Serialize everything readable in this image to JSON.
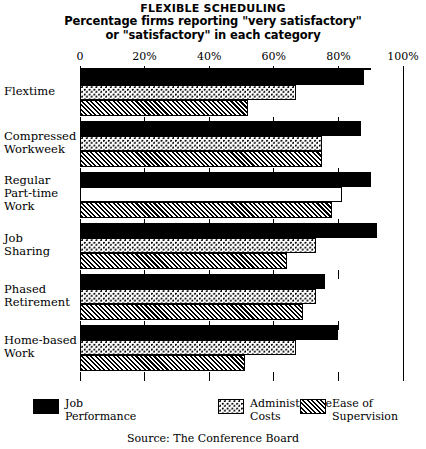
{
  "title": {
    "main": "FLEXIBLE SCHEDULING",
    "sub_line1": "Percentage firms reporting \"very satisfactory\"",
    "sub_line2": "or \"satisfactory\" in each category"
  },
  "source": "Source: The Conference Board",
  "legend": {
    "items": [
      {
        "label": "Job\nPerformance",
        "swatch": "solid-black-swatch"
      },
      {
        "label": "Administrative\nCosts",
        "swatch": "dotted-swatch"
      },
      {
        "label": "Ease of\nSupervision",
        "swatch": "hatched-swatch"
      }
    ]
  },
  "chart_data": {
    "type": "bar",
    "orientation": "horizontal",
    "xlabel": "",
    "ylabel": "",
    "xlim": [
      0,
      100
    ],
    "grid": true,
    "legend_position": "bottom",
    "tick_labels": [
      "0",
      "20%",
      "40%",
      "60%",
      "80%",
      "100%"
    ],
    "tick_values": [
      0,
      20,
      40,
      60,
      80,
      100
    ],
    "categories": [
      "Flextime",
      "Compressed\nWorkweek",
      "Regular\nPart-time\nWork",
      "Job\nSharing",
      "Phased\nRetirement",
      "Home-based\nWork"
    ],
    "series": [
      {
        "name": "Job Performance",
        "fill": "solid-black",
        "values": [
          88,
          87,
          90,
          92,
          76,
          80
        ]
      },
      {
        "name": "Administrative Costs",
        "fill": "dotted",
        "values": [
          67,
          75,
          81,
          73,
          73,
          67
        ]
      },
      {
        "name": "Ease of Supervision",
        "fill": "diagonal-hatch",
        "values": [
          52,
          75,
          78,
          64,
          69,
          51
        ]
      }
    ]
  }
}
